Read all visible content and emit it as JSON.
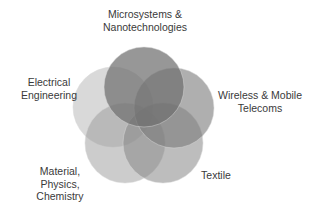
{
  "diagram": {
    "type": "venn",
    "sets": [
      {
        "id": "microsystems",
        "label_lines": [
          "Microsystems &",
          "Nanotechnologies"
        ],
        "cx": 144,
        "cy": 87,
        "r": 40,
        "color": "#6f6f6f",
        "opacity": 0.72
      },
      {
        "id": "wireless",
        "label_lines": [
          "Wireless & Mobile",
          "Telecoms"
        ],
        "cx": 174,
        "cy": 108,
        "r": 40,
        "color": "#7a7a7a",
        "opacity": 0.6
      },
      {
        "id": "textile",
        "label_lines": [
          "Textile"
        ],
        "cx": 163,
        "cy": 143,
        "r": 40,
        "color": "#868686",
        "opacity": 0.55
      },
      {
        "id": "material",
        "label_lines": [
          "Material,",
          "Physics,",
          "Chemistry"
        ],
        "cx": 125,
        "cy": 143,
        "r": 40,
        "color": "#9a9a9a",
        "opacity": 0.5
      },
      {
        "id": "electrical",
        "label_lines": [
          "Electrical",
          "Engineering"
        ],
        "cx": 113,
        "cy": 107,
        "r": 40,
        "color": "#b4b4b4",
        "opacity": 0.5
      }
    ]
  }
}
